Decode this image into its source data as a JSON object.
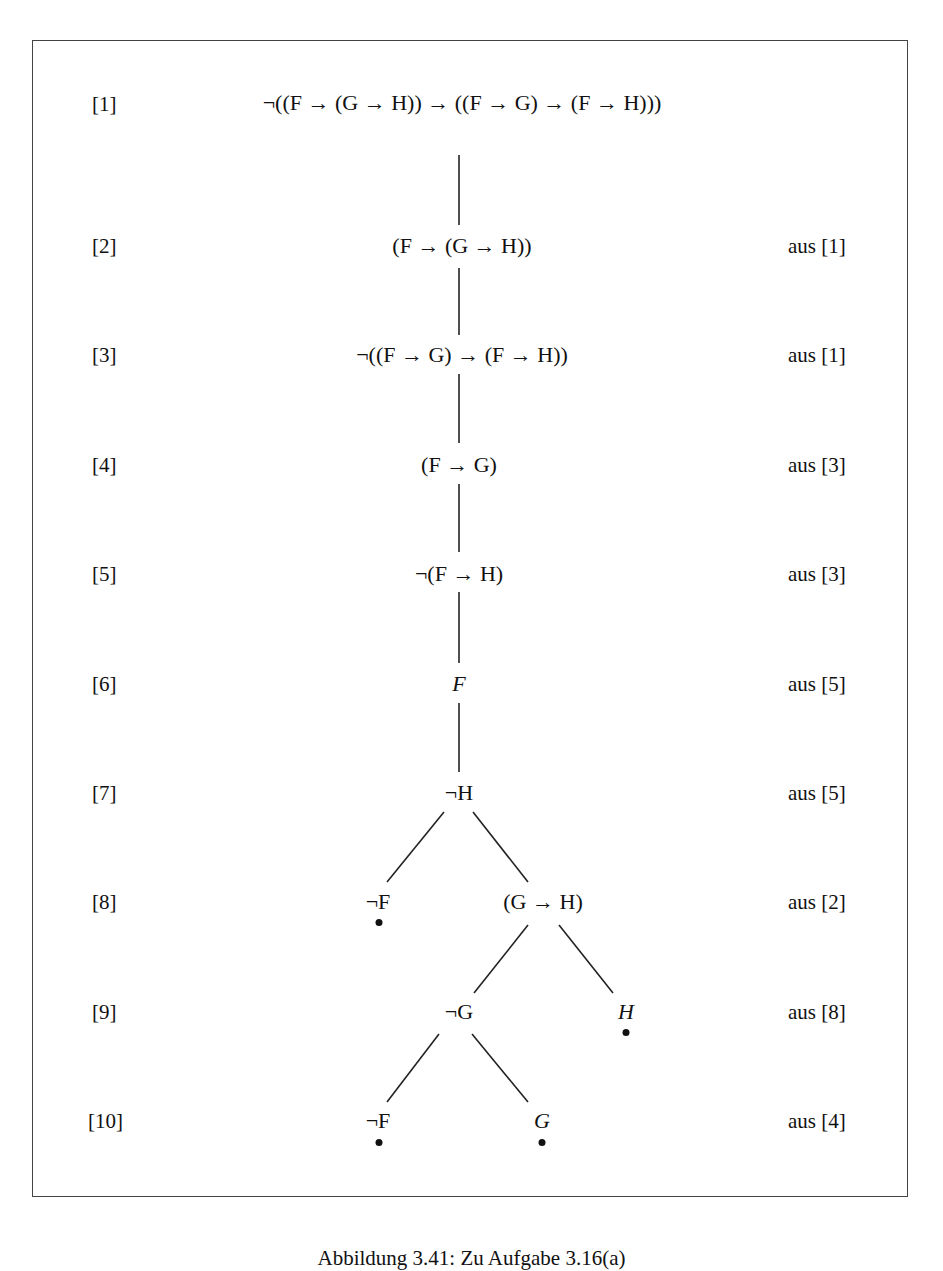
{
  "figure": {
    "caption": "Abbildung 3.41: Zu Aufgabe 3.16(a)",
    "rows": [
      {
        "label": "[1]",
        "formula": "¬((F → (G → H)) → ((F → G) → (F → H)))",
        "source": ""
      },
      {
        "label": "[2]",
        "formula": "(F → (G → H))",
        "source": "aus [1]"
      },
      {
        "label": "[3]",
        "formula": "¬((F → G) → (F → H))",
        "source": "aus [1]"
      },
      {
        "label": "[4]",
        "formula": "(F → G)",
        "source": "aus [3]"
      },
      {
        "label": "[5]",
        "formula": "¬(F → H)",
        "source": "aus [3]"
      },
      {
        "label": "[6]",
        "formula": "F",
        "source": "aus [5]"
      },
      {
        "label": "[7]",
        "formula": "¬H",
        "source": "aus [5]"
      },
      {
        "label": "[8]",
        "formula": "",
        "source": "aus [2]"
      },
      {
        "label": "[9]",
        "formula": "",
        "source": "aus [8]"
      },
      {
        "label": "[10]",
        "formula": "",
        "source": "aus [4]"
      }
    ],
    "branch_nodes": {
      "row8_left": "¬F",
      "row8_right": "(G → H)",
      "row9_left": "¬G",
      "row9_right": "H",
      "row10_left": "¬F",
      "row10_right": "G"
    },
    "closed_branch_marker": "●"
  }
}
